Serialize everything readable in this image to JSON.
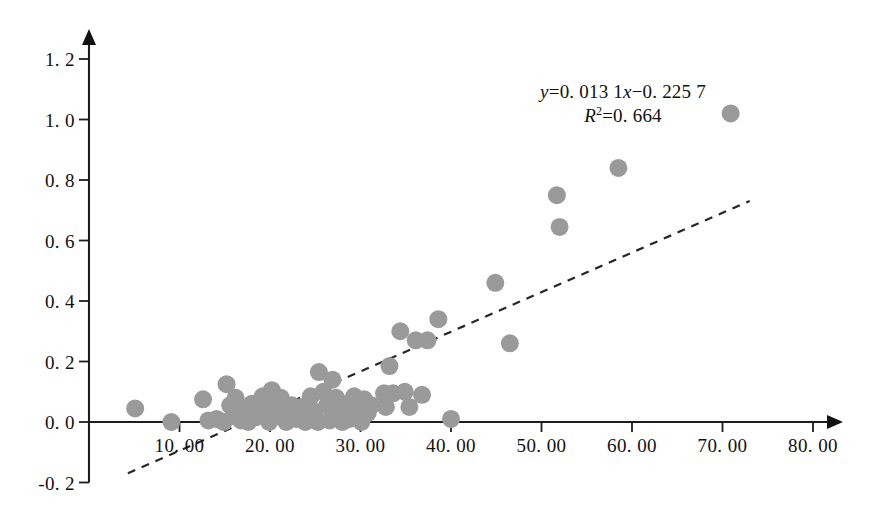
{
  "chart_data": {
    "type": "scatter",
    "title": "",
    "xlabel": "",
    "ylabel": "",
    "xlim": [
      0,
      80
    ],
    "ylim": [
      -0.2,
      1.2
    ],
    "grid": false,
    "legend": "none",
    "x_ticks": [
      "10. 00",
      "20. 00",
      "30. 00",
      "40. 00",
      "50. 00",
      "60. 00",
      "70. 00",
      "80. 00"
    ],
    "x_tick_values": [
      10,
      20,
      30,
      40,
      50,
      60,
      70,
      80
    ],
    "y_ticks": [
      "1. 2",
      "1. 0",
      "0. 8",
      "0. 6",
      "0. 4",
      "0. 2",
      "0. 0",
      "-0. 2"
    ],
    "y_tick_values": [
      1.2,
      1.0,
      0.8,
      0.6,
      0.4,
      0.2,
      0.0,
      -0.2
    ],
    "marker_color": "#9a9a9a",
    "marker_radius": 9,
    "axis_color": "#1d1d1d",
    "trendline": {
      "style": "dashed",
      "color": "#262626",
      "slope": 0.0131,
      "intercept": -0.2257,
      "x_start": 4.3,
      "x_end": 73.0
    },
    "annotations": {
      "equation_var_y": "y",
      "equation_body": "=0. 013  1",
      "equation_var_x": "x",
      "equation_tail": "−0. 225  7",
      "r_squared_var": "R",
      "r_squared_exp": "2",
      "r_squared_value": "=0. 664"
    },
    "points": [
      [
        5.1,
        0.045
      ],
      [
        9.1,
        0.0
      ],
      [
        12.6,
        0.075
      ],
      [
        15.2,
        0.125
      ],
      [
        13.2,
        0.005
      ],
      [
        14.1,
        0.01
      ],
      [
        14.9,
        0.0
      ],
      [
        15.6,
        0.055
      ],
      [
        16.2,
        0.08
      ],
      [
        16.0,
        0.02
      ],
      [
        16.8,
        0.005
      ],
      [
        17.2,
        0.04
      ],
      [
        17.6,
        0.0
      ],
      [
        18.0,
        0.06
      ],
      [
        18.4,
        0.015
      ],
      [
        18.9,
        0.045
      ],
      [
        19.2,
        0.085
      ],
      [
        19.6,
        0.03
      ],
      [
        19.9,
        0.0
      ],
      [
        20.2,
        0.105
      ],
      [
        20.5,
        0.06
      ],
      [
        20.8,
        0.02
      ],
      [
        21.2,
        0.08
      ],
      [
        21.5,
        0.04
      ],
      [
        21.8,
        0.0
      ],
      [
        22.4,
        0.055
      ],
      [
        22.9,
        0.01
      ],
      [
        23.4,
        0.05
      ],
      [
        23.9,
        0.0
      ],
      [
        24.5,
        0.085
      ],
      [
        24.9,
        0.035
      ],
      [
        25.3,
        0.0
      ],
      [
        25.4,
        0.165
      ],
      [
        25.9,
        0.1
      ],
      [
        26.3,
        0.055
      ],
      [
        26.6,
        0.005
      ],
      [
        26.9,
        0.14
      ],
      [
        27.3,
        0.08
      ],
      [
        27.6,
        0.03
      ],
      [
        28.0,
        0.0
      ],
      [
        28.5,
        0.06
      ],
      [
        28.8,
        0.01
      ],
      [
        29.3,
        0.085
      ],
      [
        29.7,
        0.04
      ],
      [
        30.1,
        0.0
      ],
      [
        30.4,
        0.075
      ],
      [
        30.8,
        0.03
      ],
      [
        31.2,
        0.055
      ],
      [
        32.6,
        0.095
      ],
      [
        32.8,
        0.05
      ],
      [
        33.2,
        0.185
      ],
      [
        33.6,
        0.095
      ],
      [
        34.4,
        0.3
      ],
      [
        34.9,
        0.1
      ],
      [
        35.4,
        0.05
      ],
      [
        36.1,
        0.27
      ],
      [
        36.8,
        0.09
      ],
      [
        37.4,
        0.27
      ],
      [
        38.6,
        0.34
      ],
      [
        40.0,
        0.01
      ],
      [
        44.9,
        0.46
      ],
      [
        46.5,
        0.26
      ],
      [
        51.7,
        0.75
      ],
      [
        52.0,
        0.645
      ],
      [
        58.5,
        0.84
      ],
      [
        70.9,
        1.02
      ]
    ]
  },
  "axis_geometry": {
    "origin_x_px": 89,
    "origin_y_px": 422,
    "x_unit_px": 9.05,
    "y_unit_px": 302.5
  }
}
